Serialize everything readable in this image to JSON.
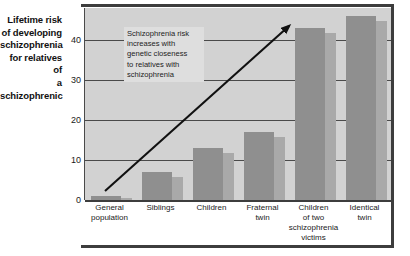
{
  "chart_data": {
    "type": "bar",
    "title": "Lifetime risk of developing schizophrenia for relatives of a schizophrenic",
    "xlabel": "",
    "ylabel": "Lifetime risk of developing schizophrenia for relatives of a schizophrenic",
    "ylim": [
      0,
      48
    ],
    "yticks": [
      0,
      10,
      20,
      30,
      40
    ],
    "ytick_labels": [
      "0",
      "10",
      "20",
      "30",
      "40"
    ],
    "grid": true,
    "legend": "none",
    "units": "percent",
    "categories": [
      "General population",
      "Siblings",
      "Children",
      "Fraternal twin",
      "Children of two schizophrenia victims",
      "Identical twin"
    ],
    "values": [
      1,
      7,
      13,
      17,
      43,
      46
    ],
    "annotations": [
      {
        "text": "Schizophrenia risk increases with genetic closeness to relatives with schizophrenia",
        "type": "textbox"
      },
      {
        "text": "",
        "type": "arrow",
        "direction": "up-right",
        "meaning": "increasing trend"
      }
    ]
  },
  "axis_caption": {
    "line1": "Lifetime risk",
    "line2": "of developing",
    "line3": "schizophrenia",
    "line4": "for relatives of",
    "line5": "a schizophrenic"
  },
  "yticks": [
    {
      "label": "40",
      "value": 40
    },
    {
      "label": "30",
      "value": 30
    },
    {
      "label": "20",
      "value": 20
    },
    {
      "label": "10",
      "value": 10
    },
    {
      "label": "0",
      "value": 0
    }
  ],
  "bars": [
    {
      "label_lines": [
        "General",
        "population"
      ],
      "value": 1,
      "label_flat": "General population"
    },
    {
      "label_lines": [
        "Siblings"
      ],
      "value": 7,
      "label_flat": "Siblings"
    },
    {
      "label_lines": [
        "Children"
      ],
      "value": 13,
      "label_flat": "Children"
    },
    {
      "label_lines": [
        "Fraternal",
        "twin"
      ],
      "value": 17,
      "label_flat": "Fraternal twin"
    },
    {
      "label_lines": [
        "Children",
        "of two",
        "schizophrenia",
        "victims"
      ],
      "value": 43,
      "label_flat": "Children of two schizophrenia victims"
    },
    {
      "label_lines": [
        "Identical",
        "twin"
      ],
      "value": 46,
      "label_flat": "Identical twin"
    }
  ],
  "annotation": {
    "line1": "Schizophrenia risk",
    "line2": "increases with",
    "line3": "genetic closeness",
    "line4": "to relatives with",
    "line5": "schizophrenia"
  },
  "colors": {
    "plot_background": "#d2d2d2",
    "bar_front": "#8f8f8f",
    "bar_shadow": "#a9a9a9",
    "gridline": "#4a4a4a",
    "frame": "#3d3d3d",
    "annotation_background": "#dedede",
    "text": "#1a1a1a"
  }
}
